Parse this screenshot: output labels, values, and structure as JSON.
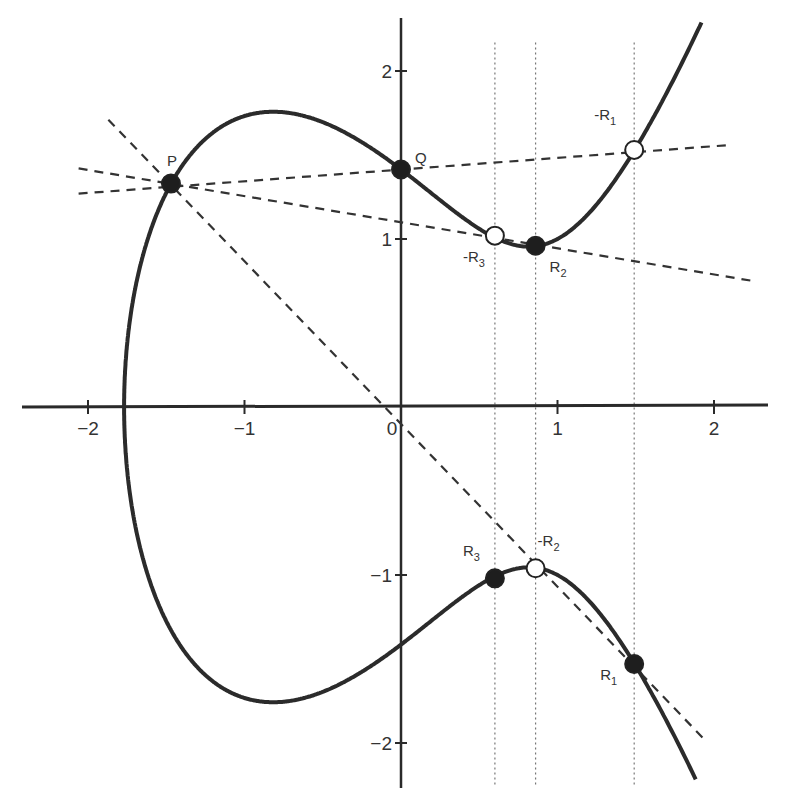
{
  "chart_data": {
    "type": "line",
    "title": "",
    "xlabel": "",
    "ylabel": "",
    "curve_equation": "y^2 = x^3 - 2x + 2",
    "xlim": [
      -2.4,
      2.35
    ],
    "ylim": [
      -2.25,
      2.3
    ],
    "grid": false,
    "x_ticks": [
      -2,
      -1,
      0,
      1,
      2
    ],
    "x_tick_labels": [
      "−2",
      "−1",
      "0",
      "1",
      "2"
    ],
    "y_ticks": [
      2,
      1,
      -1,
      -2
    ],
    "y_tick_labels": [
      "2",
      "1",
      "−1",
      "−2"
    ],
    "points": [
      {
        "name": "P",
        "label": "P",
        "x": -1.47,
        "y": 1.33,
        "filled": true
      },
      {
        "name": "Q",
        "label": "Q",
        "x": 0.0,
        "y": 1.414,
        "filled": true
      },
      {
        "name": "R2",
        "label": "R",
        "sub": "2",
        "x": 0.86,
        "y": 0.96,
        "filled": true
      },
      {
        "name": "-R3",
        "label": "-R",
        "sub": "3",
        "x": 0.6,
        "y": 1.02,
        "filled": false
      },
      {
        "name": "-R1",
        "label": "-R",
        "sub": "1",
        "x": 1.49,
        "y": 1.53,
        "filled": false
      },
      {
        "name": "R3",
        "label": "R",
        "sub": "3",
        "x": 0.6,
        "y": -1.02,
        "filled": true
      },
      {
        "name": "-R2",
        "label": "-R",
        "sub": "2",
        "x": 0.86,
        "y": -0.96,
        "filled": false
      },
      {
        "name": "R1",
        "label": "R",
        "sub": "1",
        "x": 1.49,
        "y": -1.53,
        "filled": true
      }
    ],
    "dashed_lines": [
      {
        "name": "line-PQ",
        "from": [
          -2.06,
          1.27
        ],
        "to": [
          2.11,
          1.56
        ]
      },
      {
        "name": "line-P-R2",
        "from": [
          -2.06,
          1.42
        ],
        "to": [
          2.25,
          0.75
        ]
      },
      {
        "name": "line-P-origin",
        "from": [
          -1.87,
          1.71
        ],
        "to": [
          1.95,
          -1.99
        ]
      }
    ],
    "dotted_verticals": [
      0.6,
      0.86,
      1.49
    ],
    "dotted_vertical_range": [
      -2.26,
      2.17
    ]
  },
  "figure": {
    "px_per_unit_x": 156.5,
    "px_per_unit_y": 168,
    "origin_px": [
      401,
      407
    ],
    "axis_color": "#2a2a2a",
    "curve_color": "#2b2b2b",
    "dash_color": "#333333",
    "dotted_color": "#777777"
  }
}
